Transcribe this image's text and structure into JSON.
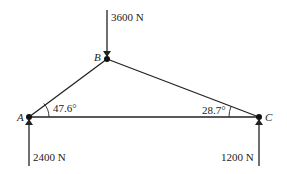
{
  "diagram": {
    "nodes": [
      {
        "id": "A",
        "label": "A",
        "x": 29,
        "y": 117
      },
      {
        "id": "B",
        "label": "B",
        "x": 107,
        "y": 59
      },
      {
        "id": "C",
        "label": "C",
        "x": 259,
        "y": 117
      }
    ],
    "members": [
      {
        "from": "A",
        "to": "B"
      },
      {
        "from": "B",
        "to": "C"
      },
      {
        "from": "A",
        "to": "C"
      }
    ],
    "angles": [
      {
        "at": "A",
        "label": "47.6°"
      },
      {
        "at": "C",
        "label": "28.7°"
      }
    ],
    "forces": [
      {
        "at": "B",
        "direction": "down",
        "label": "3600 N"
      },
      {
        "at": "A",
        "direction": "up",
        "label": "2400 N"
      },
      {
        "at": "C",
        "direction": "up",
        "label": "1200 N"
      }
    ],
    "colors": {
      "line": "#222222",
      "background": "#ffffff"
    }
  }
}
